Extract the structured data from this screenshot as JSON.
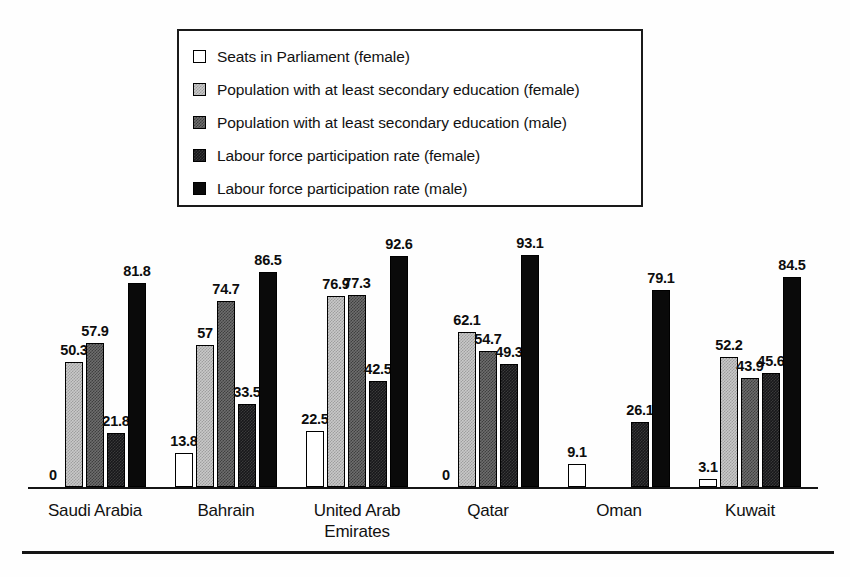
{
  "chart_data": {
    "type": "bar",
    "title": "",
    "subtitle": "",
    "xlabel": "",
    "ylabel": "",
    "ylim": [
      0,
      100
    ],
    "grid": false,
    "legend_position": "top-center",
    "categories": [
      "Saudi Arabia",
      "Bahrain",
      "United Arab Emirates",
      "Qatar",
      "Oman",
      "Kuwait"
    ],
    "category_lines": [
      [
        "Saudi Arabia"
      ],
      [
        "Bahrain"
      ],
      [
        "United Arab",
        "Emirates"
      ],
      [
        "Qatar"
      ],
      [
        "Oman"
      ],
      [
        "Kuwait"
      ]
    ],
    "series": [
      {
        "name": "Seats in Parliament (female)",
        "swatch": "white",
        "color": "#ffffff",
        "values": [
          0,
          13.8,
          22.5,
          0,
          9.1,
          3.1
        ],
        "labels": [
          "0",
          "13.8",
          "22.5",
          "0",
          "9.1",
          "3.1"
        ]
      },
      {
        "name": "Population with at least secondary education (female)",
        "swatch": "light",
        "color": "#c9c9c9",
        "values": [
          50.3,
          57,
          76.9,
          62.1,
          null,
          52.2
        ],
        "labels": [
          "50.3",
          "57",
          "76.9",
          "62.1",
          "",
          "52.2"
        ]
      },
      {
        "name": "Population with at least secondary education (male)",
        "swatch": "dark",
        "color": "#6e6e6e",
        "values": [
          57.9,
          74.7,
          77.3,
          54.7,
          null,
          43.9
        ],
        "labels": [
          "57.9",
          "74.7",
          "77.3",
          "54.7",
          "",
          "43.9"
        ]
      },
      {
        "name": "Labour force participation rate (female)",
        "swatch": "nearblack",
        "color": "#17171a",
        "values": [
          21.8,
          33.5,
          42.5,
          49.3,
          26.1,
          45.6
        ],
        "labels": [
          "21.8",
          "33.5",
          "42.5",
          "49.3",
          "26.1",
          "45.6"
        ]
      },
      {
        "name": "Labour force participation rate (male)",
        "swatch": "black",
        "color": "#0a0a0a",
        "values": [
          81.8,
          86.5,
          92.6,
          93.1,
          79.1,
          84.5
        ],
        "labels": [
          "81.8",
          "86.5",
          "92.6",
          "93.1",
          "79.1",
          "84.5"
        ]
      }
    ]
  },
  "legend": {
    "items": [
      {
        "label": "Seats in Parliament (female)",
        "swatch": "white"
      },
      {
        "label": "Population with at least secondary education (female)",
        "swatch": "light"
      },
      {
        "label": "Population with at least secondary education (male)",
        "swatch": "dark"
      },
      {
        "label": "Labour force participation rate (female)",
        "swatch": "nearblack"
      },
      {
        "label": "Labour force participation rate (male)",
        "swatch": "black"
      }
    ]
  }
}
